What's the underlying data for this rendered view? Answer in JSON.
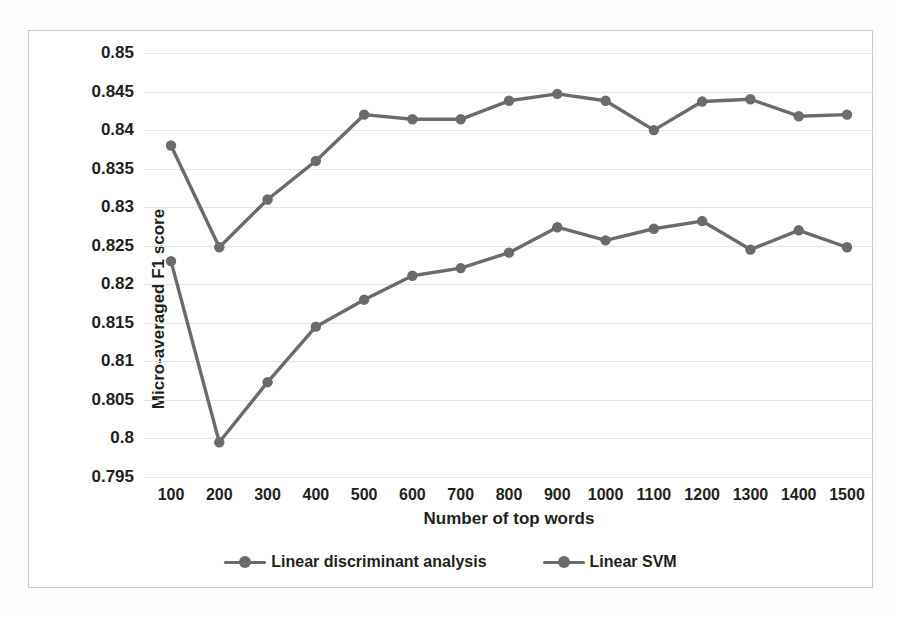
{
  "chart_data": {
    "type": "line",
    "title": "",
    "xlabel": "Number of top words",
    "ylabel": "Micro-averaged F1 score",
    "x": [
      100,
      200,
      300,
      400,
      500,
      600,
      700,
      800,
      900,
      1000,
      1100,
      1200,
      1300,
      1400,
      1500
    ],
    "xtick_labels": [
      "100",
      "200",
      "300",
      "400",
      "500",
      "600",
      "700",
      "800",
      "900",
      "1000",
      "1100",
      "1200",
      "1300",
      "1400",
      "1500"
    ],
    "ytick_labels": [
      "0.85",
      "0.845",
      "0.84",
      "0.835",
      "0.83",
      "0.825",
      "0.82",
      "0.815",
      "0.81",
      "0.805",
      "0.8",
      "0.795"
    ],
    "ytick_values": [
      0.85,
      0.845,
      0.84,
      0.835,
      0.83,
      0.825,
      0.82,
      0.815,
      0.81,
      0.805,
      0.8,
      0.795
    ],
    "ylim": [
      0.795,
      0.85
    ],
    "xlim": [
      100,
      1500
    ],
    "grid": true,
    "legend_position": "bottom",
    "series": [
      {
        "name": "Linear discriminant analysis",
        "color": "#6b6b6b",
        "values": [
          0.838,
          0.8248,
          0.831,
          0.836,
          0.842,
          0.8414,
          0.8414,
          0.8438,
          0.8447,
          0.8438,
          0.84,
          0.8437,
          0.844,
          0.8418,
          0.842
        ]
      },
      {
        "name": "Linear SVM",
        "color": "#6b6b6b",
        "values": [
          0.823,
          0.7995,
          0.8073,
          0.8145,
          0.818,
          0.8211,
          0.8221,
          0.8241,
          0.8274,
          0.8257,
          0.8272,
          0.8282,
          0.8245,
          0.827,
          0.8248
        ]
      }
    ]
  },
  "legend": {
    "items": [
      {
        "label": "Linear discriminant analysis",
        "color": "#6b6b6b"
      },
      {
        "label": "Linear SVM",
        "color": "#6b6b6b"
      }
    ]
  },
  "colors": {
    "series": "#6b6b6b",
    "gridline": "#e4e4e8",
    "frame": "#c9c9cc",
    "text": "#231f20"
  }
}
